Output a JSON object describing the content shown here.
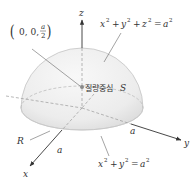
{
  "diagram": {
    "type": "hemisphere-center-of-mass",
    "axes": {
      "x_label": "x",
      "y_label": "y",
      "z_label": "z"
    },
    "labels": {
      "centroid_point": {
        "open": "(",
        "coords": "0, 0,",
        "frac_num": "a",
        "frac_den": "2",
        "close": ")"
      },
      "centroid_text": "질량중심",
      "centroid_symbol": "S",
      "sphere_eq": {
        "x": "x",
        "y": "y",
        "z": "z",
        "a": "a",
        "exp": "2",
        "plus": "+",
        "eq": "="
      },
      "region": "R",
      "radius_x": "a",
      "radius_y": "a",
      "base_eq": {
        "x": "x",
        "y": "y",
        "a": "a",
        "exp": "2",
        "plus": "+",
        "eq": "="
      }
    },
    "colors": {
      "surface_light": "#f2f2f2",
      "surface_dark": "#dcdcdc",
      "edge": "#bdbdbd",
      "axis": "#333333",
      "dashed": "#9a9a9a",
      "leader": "#666666",
      "dot": "#888888"
    }
  }
}
